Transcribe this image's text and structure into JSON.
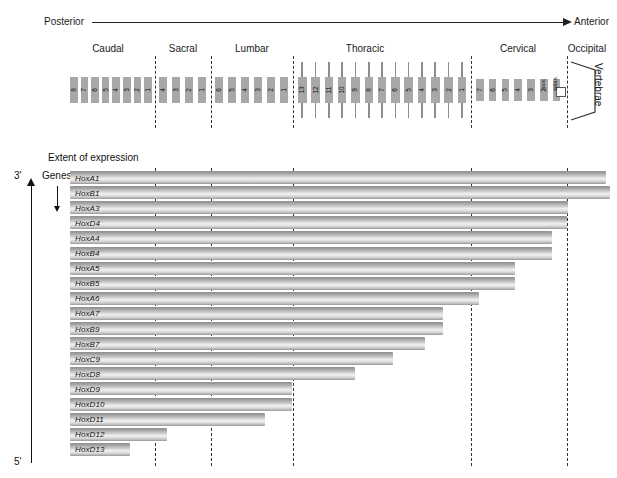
{
  "axis": {
    "left_label": "Posterior",
    "right_label": "Anterior",
    "arrow_icon": "right-arrow-icon"
  },
  "regions": [
    {
      "name": "Caudal",
      "label": "Caudal"
    },
    {
      "name": "Sacral",
      "label": "Sacral"
    },
    {
      "name": "Lumbar",
      "label": "Lumbar"
    },
    {
      "name": "Thoracic",
      "label": "Thoracic"
    },
    {
      "name": "Cervical",
      "label": "Cervical"
    },
    {
      "name": "Occipital",
      "label": "Occipital"
    }
  ],
  "vertebrae": {
    "bracket_label": "Vertebrae",
    "caudal": [
      "8",
      "7",
      "6",
      "5",
      "4",
      "3",
      "2",
      "1"
    ],
    "sacral": [
      "4",
      "3",
      "2",
      "1"
    ],
    "lumbar": [
      "6",
      "5",
      "4",
      "3",
      "2",
      "1"
    ],
    "thoracic": [
      "13",
      "12",
      "11",
      "10",
      "9",
      "8",
      "7",
      "6",
      "5",
      "4",
      "3",
      "2",
      "1"
    ],
    "cervical": [
      "7",
      "6",
      "5",
      "4",
      "3",
      "2",
      "1"
    ],
    "axis_label": "axis",
    "atlas_label": "atlas"
  },
  "chart_panel": {
    "extent_title": "Extent of expression",
    "genes_label": "Genes",
    "three_prime": "3'",
    "five_prime": "5'"
  },
  "chart_data": {
    "type": "bar",
    "title": "Extent of expression",
    "xlabel": "",
    "ylabel": "Genes",
    "orientation": "horizontal",
    "categories": [
      "HoxA1",
      "HoxB1",
      "HoxA3",
      "HoxD4",
      "HoxA4",
      "HoxB4",
      "HoxA5",
      "HoxB5",
      "HoxA6",
      "HoxA7",
      "HoxB9",
      "HoxB7",
      "HoxC9",
      "HoxD8",
      "HoxD9",
      "HoxD10",
      "HoxD11",
      "HoxD12",
      "HoxD13"
    ],
    "values": [
      606,
      610,
      568,
      567,
      552,
      552,
      515,
      515,
      479,
      443,
      443,
      425,
      393,
      355,
      292,
      292,
      265,
      167,
      130
    ],
    "value_unit": "anterior-most extent (px along posterior-anterior axis)",
    "bar_start": 70,
    "axis_ranges": {
      "x": [
        70,
        617
      ]
    },
    "grid": false,
    "legend": "none",
    "region_boundaries": [
      {
        "label": "Caudal/Sacral",
        "x": 155
      },
      {
        "label": "Sacral/Lumbar",
        "x": 211
      },
      {
        "label": "Lumbar/Thoracic",
        "x": 293
      },
      {
        "label": "Thoracic/Cervical",
        "x": 471
      },
      {
        "label": "Cervical/Occipital",
        "x": 567
      }
    ]
  },
  "colors": {
    "bar_light": "#f2f2f2",
    "bar_mid": "#b4b4b4",
    "bar_dark": "#8f8f8f",
    "vertebra_fill": "#a8a8a8",
    "dashed_line": "#333333",
    "text": "#111111"
  }
}
